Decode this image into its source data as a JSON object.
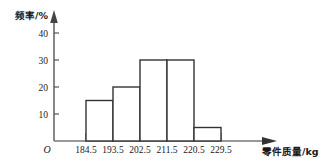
{
  "chart_data": {
    "type": "bar",
    "title": "",
    "subtitle": "",
    "xlabel": "零件质量/kg",
    "ylabel": "频率/%",
    "origin_label": "O",
    "grid": false,
    "legend": "none",
    "bin_edges": [
      "184.5",
      "193.5",
      "202.5",
      "211.5",
      "220.5",
      "229.5"
    ],
    "categories": [
      "184.5-193.5",
      "193.5-202.5",
      "202.5-211.5",
      "211.5-220.5",
      "220.5-229.5"
    ],
    "values": [
      15,
      20,
      30,
      30,
      5
    ],
    "x_ticks": [
      "184.5",
      "193.5",
      "202.5",
      "211.5",
      "220.5",
      "229.5"
    ],
    "y_ticks": [
      "10",
      "20",
      "30",
      "40"
    ],
    "y_tick_values": [
      10,
      20,
      30,
      40
    ],
    "ylim": [
      0,
      48
    ],
    "xlim": [
      184.5,
      229.5
    ],
    "bar_fill": "#ffffff",
    "bar_stroke": "#333333",
    "axis_color": "#555555"
  }
}
